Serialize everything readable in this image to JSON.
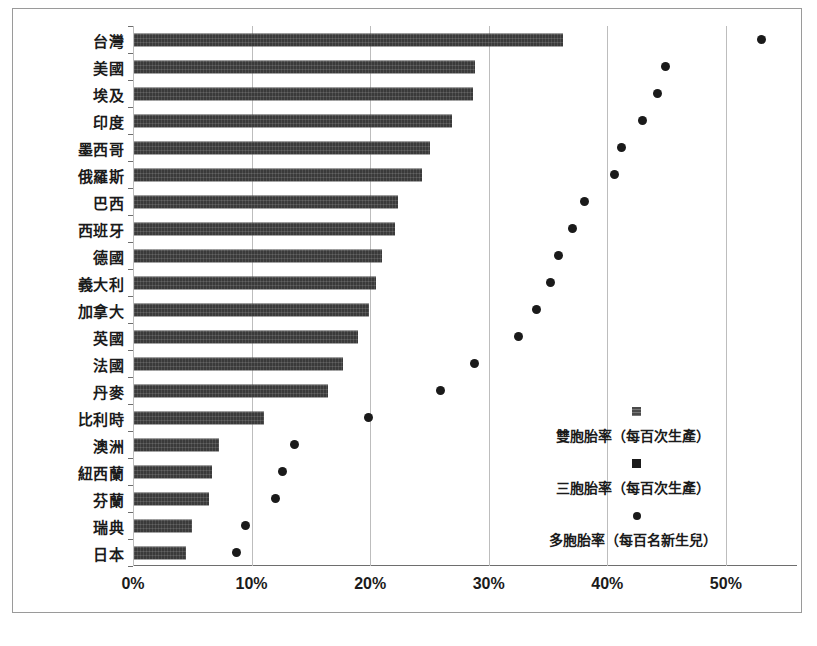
{
  "chart_data": {
    "type": "bar",
    "title": "",
    "subtitle": "",
    "xlabel": "",
    "ylabel": "",
    "xlim": [
      0,
      56
    ],
    "xticks": [
      "0%",
      "10%",
      "20%",
      "30%",
      "40%",
      "50%"
    ],
    "xtick_values": [
      0,
      10,
      20,
      30,
      40,
      50
    ],
    "grid": "vertical",
    "legend_position": "inside-lower-right",
    "categories": [
      "台灣",
      "美國",
      "埃及",
      "印度",
      "墨西哥",
      "俄羅斯",
      "巴西",
      "西班牙",
      "德國",
      "義大利",
      "加拿大",
      "英國",
      "法國",
      "丹麥",
      "比利時",
      "澳洲",
      "紐西蘭",
      "芬蘭",
      "瑞典",
      "日本"
    ],
    "series": [
      {
        "name": "雙胞胎率（每百次生產）",
        "marker": "bar",
        "values": [
          36.2,
          28.8,
          28.6,
          26.8,
          25.0,
          24.3,
          22.3,
          22.0,
          20.9,
          20.4,
          19.8,
          18.9,
          17.6,
          16.4,
          11.0,
          7.2,
          6.6,
          6.3,
          4.9,
          4.4
        ]
      },
      {
        "name": "多胞胎率（每百名新生兒）",
        "marker": "circle",
        "values": [
          53.0,
          44.9,
          44.2,
          43.0,
          41.2,
          40.6,
          38.1,
          37.1,
          35.9,
          35.2,
          34.0,
          32.5,
          28.8,
          25.9,
          19.9,
          13.6,
          12.6,
          12.0,
          9.5,
          8.7
        ]
      }
    ],
    "legend": [
      {
        "label": "雙胞胎率（每百次生產）",
        "marker": "square-hatched"
      },
      {
        "label": "三胞胎率（每百次生產）",
        "marker": "square-solid"
      },
      {
        "label": "多胞胎率（每百名新生兒）",
        "marker": "circle"
      }
    ],
    "colors": {
      "bar": "#3a3a3a",
      "dot": "#1a1a1a",
      "grid": "#bdbdbd",
      "axis": "#6e6e6e",
      "background": "#ffffff"
    }
  }
}
